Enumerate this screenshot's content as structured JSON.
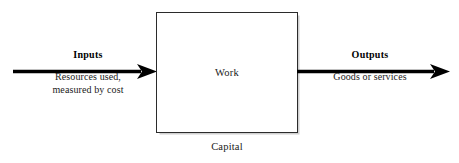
{
  "diagram": {
    "type": "process-flow",
    "process": {
      "box_label": "Work",
      "caption_below": "Capital"
    },
    "input": {
      "title": "Inputs",
      "description_line1": "Resources used,",
      "description_line2": "measured by cost",
      "arrow_direction": "right"
    },
    "output": {
      "title": "Outputs",
      "description_line1": "Goods or services",
      "arrow_direction": "right"
    },
    "colors": {
      "stroke": "#000000",
      "box_border": "#2b2b2b",
      "background": "#ffffff",
      "text": "#1a1a1a"
    }
  }
}
